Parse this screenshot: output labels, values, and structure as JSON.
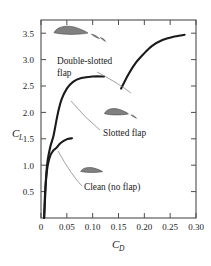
{
  "chart_data": {
    "type": "line",
    "title": "",
    "xlabel": "C_D",
    "ylabel": "C_L",
    "xlim": [
      0,
      0.3
    ],
    "ylim": [
      0,
      3.75
    ],
    "grid": false,
    "legend_position": "inline-annotations",
    "xticks": [
      "0",
      "0.05",
      "0.10",
      "0.15",
      "0.20",
      "0.25",
      "0.30"
    ],
    "xtick_values": [
      0,
      0.05,
      0.1,
      0.15,
      0.2,
      0.25,
      0.3
    ],
    "yticks": [
      "0.5",
      "1.0",
      "1.5",
      "2.0",
      "2.5",
      "3.0",
      "3.5"
    ],
    "ytick_values": [
      0.5,
      1.0,
      1.5,
      2.0,
      2.5,
      3.0,
      3.5
    ],
    "series": [
      {
        "name": "Clean (no flap)",
        "points": [
          [
            0.006,
            0.0
          ],
          [
            0.007,
            0.25
          ],
          [
            0.008,
            0.5
          ],
          [
            0.01,
            0.75
          ],
          [
            0.013,
            1.0
          ],
          [
            0.018,
            1.18
          ],
          [
            0.024,
            1.28
          ],
          [
            0.03,
            1.33
          ],
          [
            0.036,
            1.4
          ],
          [
            0.044,
            1.46
          ],
          [
            0.053,
            1.5
          ],
          [
            0.06,
            1.51
          ]
        ]
      },
      {
        "name": "Slotted flap",
        "points": [
          [
            0.006,
            0.0
          ],
          [
            0.008,
            0.4
          ],
          [
            0.01,
            0.8
          ],
          [
            0.013,
            1.1
          ],
          [
            0.018,
            1.35
          ],
          [
            0.024,
            1.55
          ],
          [
            0.028,
            1.75
          ],
          [
            0.033,
            2.0
          ],
          [
            0.04,
            2.25
          ],
          [
            0.05,
            2.45
          ],
          [
            0.062,
            2.58
          ],
          [
            0.078,
            2.65
          ],
          [
            0.1,
            2.68
          ],
          [
            0.122,
            2.68
          ]
        ]
      },
      {
        "name": "Double-slotted flap",
        "points": [
          [
            0.155,
            2.45
          ],
          [
            0.168,
            2.7
          ],
          [
            0.182,
            2.92
          ],
          [
            0.198,
            3.1
          ],
          [
            0.215,
            3.26
          ],
          [
            0.235,
            3.37
          ],
          [
            0.255,
            3.43
          ],
          [
            0.278,
            3.47
          ]
        ]
      }
    ],
    "annotations": [
      {
        "name": "Double-slotted flap",
        "lines": [
          "Double-slotted",
          "flap"
        ],
        "data_anchor": [
          0.185,
          2.95
        ]
      },
      {
        "name": "Slotted flap",
        "lines": [
          "Slotted flap"
        ],
        "data_anchor": [
          0.04,
          2.22
        ]
      },
      {
        "name": "Clean (no flap)",
        "lines": [
          "Clean (no flap)"
        ],
        "data_anchor": [
          0.018,
          1.22
        ]
      }
    ],
    "airfoil_icons": [
      {
        "name": "double-slotted-flap-airfoil",
        "data_pos": [
          0.058,
          3.54
        ],
        "elements": 3
      },
      {
        "name": "slotted-flap-airfoil",
        "data_pos": [
          0.146,
          2.0
        ],
        "elements": 2
      },
      {
        "name": "clean-airfoil",
        "data_pos": [
          0.098,
          0.9
        ],
        "elements": 1
      }
    ]
  },
  "axis": {
    "y_label_main": "C",
    "y_label_sub": "L",
    "x_label_main": "C",
    "x_label_sub": "D"
  },
  "colors": {
    "curve": "#1a1a1a",
    "frame": "#4d4d4d",
    "airfoil_fill": "#808080",
    "airfoil_stroke": "#4a4a4a",
    "leader": "#8a8a8a",
    "text": "#1a1a1a",
    "background": "#ffffff"
  }
}
